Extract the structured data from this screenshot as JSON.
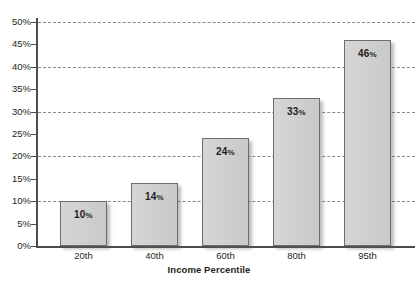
{
  "chart_data": {
    "type": "bar",
    "title": "",
    "xlabel": "Income Percentile",
    "ylabel": "",
    "categories": [
      "20th",
      "40th",
      "60th",
      "80th",
      "95th"
    ],
    "values": [
      10,
      14,
      24,
      33,
      46
    ],
    "data_labels": [
      "10%",
      "14%",
      "24%",
      "33%",
      "46%"
    ],
    "ylim": [
      0,
      50
    ],
    "ytick_labels": [
      "0%",
      "5%",
      "10%",
      "15%",
      "20%",
      "25%",
      "30%",
      "35%",
      "40%",
      "45%",
      "50%"
    ],
    "ytick_values": [
      0,
      5,
      10,
      15,
      20,
      25,
      30,
      35,
      40,
      45,
      50
    ],
    "gridline_values": [
      10,
      20,
      30,
      40,
      50
    ],
    "grid": true,
    "legend": false,
    "legend_position": "none",
    "series": [
      {
        "name": "Percent",
        "values": [
          10,
          14,
          24,
          33,
          46
        ]
      }
    ],
    "colors": {
      "bar_fill": "#d0d0d0",
      "bar_border": "#6e6e6e",
      "axis": "#4d4d4d",
      "gridline": "#8a8a8a",
      "text": "#231f20",
      "background": "#ffffff"
    }
  }
}
